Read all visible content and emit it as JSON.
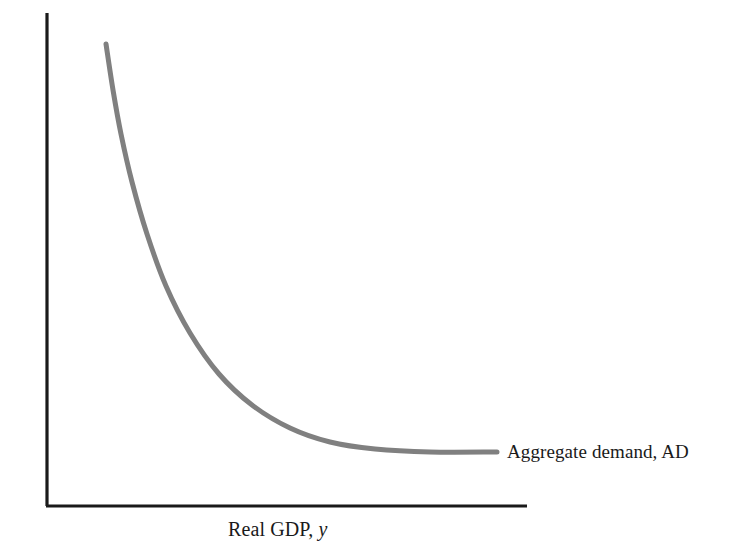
{
  "figure": {
    "background_color": "#ffffff",
    "axis_color": "#1a1a1a",
    "curve_color": "#808080",
    "text_color": "#1a1a1a"
  },
  "axes": {
    "y_label_text": "Price level, ",
    "y_label_symbol": "P",
    "x_label_text": "Real GDP, ",
    "x_label_symbol": "y"
  },
  "annotations": {
    "curve_label": "Aggregate demand, AD"
  },
  "chart_data": {
    "type": "line",
    "title": "",
    "xlabel": "Real GDP, y",
    "ylabel": "Price level, P",
    "grid": false,
    "legend_position": "inline-right-of-curve",
    "axis_style": "open-L-axes-no-ticks",
    "xlim": [
      0,
      100
    ],
    "ylim": [
      0,
      100
    ],
    "series": [
      {
        "name": "Aggregate demand, AD",
        "color": "#808080",
        "line_width": 5,
        "shape": "downward-sloping convex hyperbola",
        "x": [
          12,
          14,
          16,
          19,
          23,
          28,
          34,
          41,
          49,
          58,
          68,
          78,
          88,
          94
        ],
        "y": [
          94,
          83,
          73,
          62,
          52,
          43,
          35,
          28,
          22,
          17,
          13,
          11,
          10,
          10
        ],
        "pixel_points": [
          [
            106,
            44
          ],
          [
            113,
            90
          ],
          [
            121,
            134
          ],
          [
            132,
            182
          ],
          [
            147,
            234
          ],
          [
            166,
            286
          ],
          [
            190,
            333
          ],
          [
            219,
            374
          ],
          [
            252,
            405
          ],
          [
            290,
            428
          ],
          [
            330,
            442
          ],
          [
            375,
            449
          ],
          [
            430,
            452
          ],
          [
            497,
            452
          ]
        ]
      }
    ],
    "annotations": [
      {
        "text": "Aggregate demand, AD",
        "x_pixel": 507,
        "y_pixel": 452
      }
    ]
  }
}
